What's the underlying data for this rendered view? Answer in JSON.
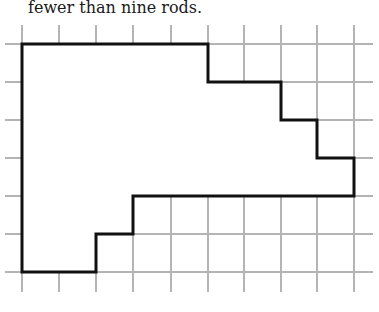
{
  "caption": "fewer than nine rods.",
  "colors": {
    "grid": "#b4b4b4",
    "outline": "#111111",
    "background": "#ffffff",
    "shape_fill": "#ffffff"
  },
  "grid": {
    "columns_x": [
      22,
      59,
      96,
      133,
      171,
      208,
      244,
      281,
      317,
      354
    ],
    "rows_y": [
      44,
      82,
      120,
      158,
      196,
      234,
      272
    ],
    "h_line_extent": [
      5,
      373
    ],
    "v_line_extent": [
      25,
      292
    ]
  },
  "shape": {
    "description": "Rectilinear polygon drawn on grid; vertices as [col,row] indices",
    "vertices": [
      [
        0,
        0
      ],
      [
        5,
        0
      ],
      [
        5,
        1
      ],
      [
        7,
        1
      ],
      [
        7,
        2
      ],
      [
        8,
        2
      ],
      [
        8,
        3
      ],
      [
        9,
        3
      ],
      [
        9,
        4
      ],
      [
        3,
        4
      ],
      [
        3,
        5
      ],
      [
        2,
        5
      ],
      [
        2,
        6
      ],
      [
        0,
        6
      ]
    ]
  }
}
